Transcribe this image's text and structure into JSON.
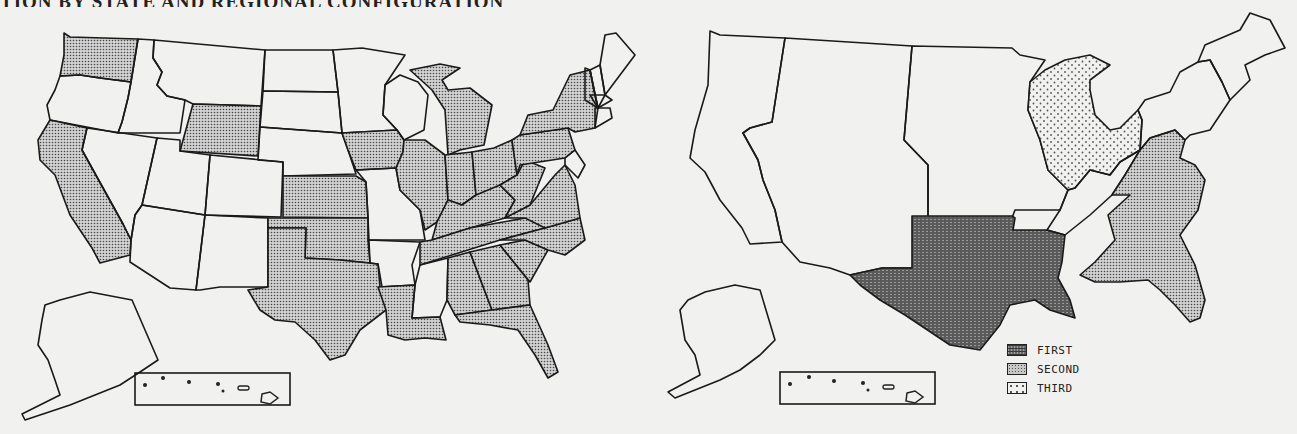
{
  "document": {
    "title_fragment": "TION BY STATE AND REGIONAL CONFIGURATION"
  },
  "map_left": {
    "description": "U.S. states map with selected states shaded (dotted pattern)",
    "shaded_states": [
      "WA",
      "CA",
      "WY",
      "KS",
      "OK",
      "TX",
      "LA",
      "IA",
      "IL",
      "IN",
      "MI",
      "OH",
      "KY",
      "TN",
      "WV",
      "VA",
      "NC",
      "SC",
      "GA",
      "AL",
      "FL",
      "PA",
      "NY",
      "MD",
      "NJ"
    ],
    "unshaded_states": [
      "OR",
      "ID",
      "MT",
      "NV",
      "UT",
      "AZ",
      "CO",
      "NM",
      "ND",
      "SD",
      "NE",
      "MN",
      "WI",
      "MO",
      "AR",
      "MS",
      "ME",
      "NH",
      "VT",
      "MA",
      "CT",
      "RI",
      "DE",
      "AK",
      "HI"
    ],
    "insets": [
      "Alaska",
      "Hawaii"
    ]
  },
  "map_right": {
    "description": "U.S. regional configuration map",
    "regions": [
      {
        "name": "Northwest / Pacific",
        "rank": null
      },
      {
        "name": "Mountain",
        "rank": null
      },
      {
        "name": "Plains",
        "rank": null
      },
      {
        "name": "South Central (TX, OK, AR, LA)",
        "rank": "FIRST"
      },
      {
        "name": "Southeast / Mid-Atlantic",
        "rank": "SECOND"
      },
      {
        "name": "Great Lakes / Midwest",
        "rank": "THIRD"
      },
      {
        "name": "Northeast",
        "rank": null
      },
      {
        "name": "New England",
        "rank": null
      },
      {
        "name": "Tennessee Valley",
        "rank": null
      }
    ],
    "insets": [
      "Alaska",
      "Hawaii"
    ]
  },
  "legend": {
    "items": [
      {
        "label": "FIRST",
        "pattern": "dense-crosshatch"
      },
      {
        "label": "SECOND",
        "pattern": "fine-dots"
      },
      {
        "label": "THIRD",
        "pattern": "sparse-dots"
      }
    ]
  },
  "colors": {
    "background": "#f1f1f0",
    "outline": "#1a1a1a",
    "first_fill": "#6b6b6b",
    "second_fill": "#c8c8c8",
    "third_fill": "#f1f1f0"
  }
}
